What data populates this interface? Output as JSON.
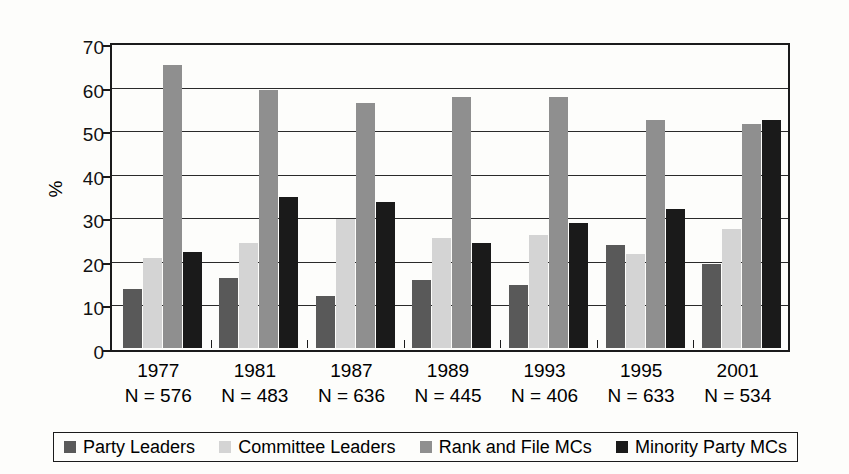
{
  "chart_data": {
    "type": "bar",
    "title": "",
    "xlabel": "",
    "ylabel": "%",
    "ylim": [
      0,
      70
    ],
    "yticks": [
      0,
      10,
      20,
      30,
      40,
      50,
      60,
      70
    ],
    "grid": true,
    "legend_position": "bottom",
    "categories": [
      "1977",
      "1981",
      "1987",
      "1989",
      "1993",
      "1995",
      "2001"
    ],
    "category_sublabels": [
      "N = 576",
      "N = 483",
      "N = 636",
      "N = 445",
      "N = 406",
      "N = 633",
      "N = 534"
    ],
    "series": [
      {
        "name": "Party Leaders",
        "color": "#595959",
        "values": [
          13.5,
          16.0,
          12.0,
          15.7,
          14.5,
          23.7,
          19.2
        ]
      },
      {
        "name": "Committee Leaders",
        "color": "#d4d4d4",
        "values": [
          20.7,
          24.1,
          29.7,
          25.2,
          26.0,
          21.6,
          27.3
        ]
      },
      {
        "name": "Rank and File MCs",
        "color": "#8f8f8f",
        "values": [
          65.0,
          59.3,
          56.3,
          57.7,
          57.6,
          52.3,
          51.5
        ]
      },
      {
        "name": "Minority Party MCs",
        "color": "#1a1a1a",
        "values": [
          22.0,
          34.7,
          33.4,
          24.2,
          28.8,
          32.0,
          52.3
        ]
      }
    ]
  },
  "figure": {
    "background_color": "#fdfdfb",
    "axis_color": "#1b1b1b"
  }
}
